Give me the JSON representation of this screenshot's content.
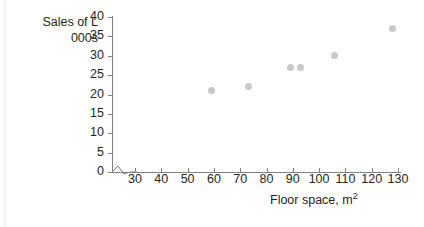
{
  "chart_data": {
    "type": "scatter",
    "title": "",
    "xlabel": "Floor space, m2",
    "xlabel_base": "Floor space, m",
    "xlabel_sup": "2",
    "ylabel_line1": "Sales of L",
    "ylabel_line2": "000s",
    "xlim": [
      25,
      133
    ],
    "ylim": [
      0,
      40
    ],
    "x_ticks": [
      30,
      40,
      50,
      60,
      70,
      80,
      90,
      100,
      110,
      120,
      130
    ],
    "y_ticks": [
      0,
      5,
      10,
      15,
      20,
      25,
      30,
      35,
      40
    ],
    "grid": false,
    "legend": "none",
    "axis_break_x": true,
    "marker_color": "#c9c9c9",
    "axis_color": "#808080",
    "text_color": "#231f20",
    "points": [
      {
        "x": 59,
        "y": 21
      },
      {
        "x": 73,
        "y": 22
      },
      {
        "x": 89,
        "y": 27
      },
      {
        "x": 93,
        "y": 27
      },
      {
        "x": 106,
        "y": 30
      },
      {
        "x": 128,
        "y": 37
      }
    ]
  }
}
